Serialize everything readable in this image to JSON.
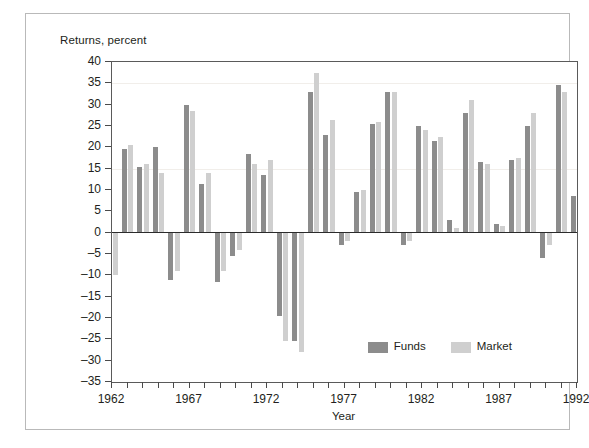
{
  "figure": {
    "y_axis_title": "Returns, percent",
    "x_axis_title": "Year"
  },
  "legend": {
    "position": "inside-bottom-center",
    "entries": [
      {
        "name": "funds",
        "label": "Funds",
        "color": "#8c8c8c"
      },
      {
        "name": "market",
        "label": "Market",
        "color": "#cfcfcf"
      }
    ]
  },
  "chart_data": {
    "type": "bar",
    "title": "",
    "subtitle": "",
    "xlabel": "Year",
    "ylabel": "Returns, percent",
    "ylim": [
      -35,
      40
    ],
    "xlim": [
      1962,
      1992
    ],
    "grid": false,
    "y_ticks": [
      40,
      35,
      30,
      25,
      20,
      15,
      10,
      5,
      0,
      -5,
      -10,
      -15,
      -20,
      -25,
      -30,
      -35
    ],
    "y_tick_labels": [
      "40",
      "35",
      "30",
      "25",
      "20",
      "15",
      "10",
      "5",
      "0",
      "–5",
      "–10",
      "–15",
      "–20",
      "–25",
      "–30",
      "–35"
    ],
    "x_ticks": [
      1962,
      1963,
      1964,
      1965,
      1966,
      1967,
      1968,
      1969,
      1970,
      1971,
      1972,
      1973,
      1974,
      1975,
      1976,
      1977,
      1978,
      1979,
      1980,
      1981,
      1982,
      1983,
      1984,
      1985,
      1986,
      1987,
      1988,
      1989,
      1990,
      1991,
      1992
    ],
    "x_tick_labels_shown": [
      "1962",
      "1967",
      "1972",
      "1977",
      "1982",
      "1987",
      "1992"
    ],
    "categories": [
      1962,
      1963,
      1964,
      1965,
      1966,
      1967,
      1968,
      1969,
      1970,
      1971,
      1972,
      1973,
      1974,
      1975,
      1976,
      1977,
      1978,
      1979,
      1980,
      1981,
      1982,
      1983,
      1984,
      1985,
      1986,
      1987,
      1988,
      1989,
      1990,
      1991,
      1992
    ],
    "series": [
      {
        "name": "Funds",
        "color": "#8c8c8c",
        "values": [
          -14.0,
          19.5,
          15.5,
          20.0,
          -11.0,
          30.0,
          11.5,
          -11.5,
          -5.5,
          18.5,
          13.5,
          -19.5,
          -25.5,
          33.0,
          23.0,
          -3.0,
          9.5,
          25.5,
          33.0,
          -3.0,
          25.0,
          21.5,
          3.0,
          28.0,
          16.5,
          2.0,
          17.0,
          25.0,
          -6.0,
          34.5,
          8.5
        ]
      },
      {
        "name": "Market",
        "color": "#cfcfcf",
        "values": [
          -10.0,
          20.5,
          16.0,
          14.0,
          -9.0,
          28.5,
          14.0,
          -9.0,
          -4.0,
          16.0,
          17.0,
          -25.5,
          -28.0,
          37.5,
          26.5,
          -2.0,
          10.0,
          26.0,
          33.0,
          -2.0,
          24.0,
          22.5,
          1.0,
          31.0,
          16.0,
          1.5,
          17.5,
          28.0,
          -3.0,
          33.0,
          8.5
        ]
      }
    ]
  }
}
